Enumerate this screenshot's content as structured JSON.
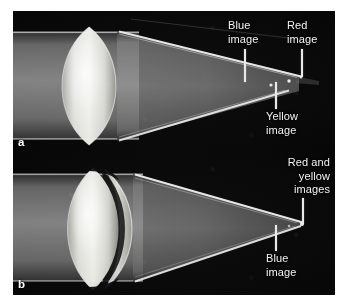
{
  "figure": {
    "kind": "photograph",
    "background_color": "#ffffff",
    "field_color": "#050505",
    "annotation_color": "#f2f2f2",
    "beam_color": "#b9b9b9"
  },
  "panels": [
    {
      "letter": "a",
      "caption_letter": "a",
      "lens": "simple biconvex singlet lens",
      "description": "Collimated beam passing through a single uncorrected lens converging to several separated colour foci",
      "annotations": [
        {
          "id": "blue",
          "text": "Blue\nimage",
          "align": "left"
        },
        {
          "id": "red",
          "text": "Red\nimage",
          "align": "left"
        },
        {
          "id": "yellow",
          "text": "Yellow\nimage",
          "align": "left"
        }
      ]
    },
    {
      "letter": "b",
      "caption_letter": "b",
      "lens": "achromatic doublet (two cemented elements)",
      "description": "Collimated beam through an achromatic doublet converging to a nearly common focus",
      "annotations": [
        {
          "id": "red-yellow",
          "text": "Red and\nyellow\nimages",
          "align": "right"
        },
        {
          "id": "blue-b",
          "text": "Blue\nimage",
          "align": "left"
        }
      ]
    }
  ],
  "labels": {
    "blue_image": "Blue\nimage",
    "red_image": "Red\nimage",
    "yellow_image": "Yellow\nimage",
    "red_and_yellow_images": "Red and\nyellow\nimages",
    "blue_image_b": "Blue\nimage",
    "panel_a": "a",
    "panel_b": "b"
  }
}
